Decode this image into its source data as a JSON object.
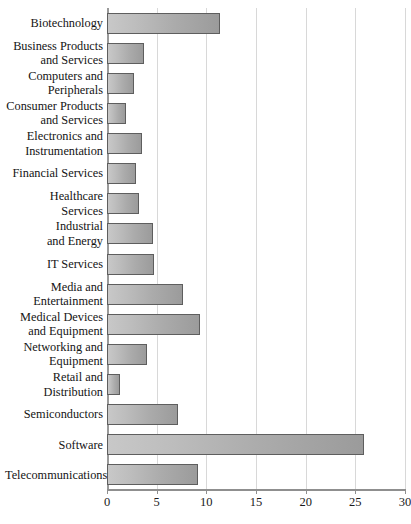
{
  "chart_data": {
    "type": "bar",
    "orientation": "horizontal",
    "title": "",
    "xlabel": "",
    "ylabel": "",
    "xlim": [
      0,
      30
    ],
    "xticks": [
      0,
      5,
      10,
      15,
      20,
      25,
      30
    ],
    "xtick_labels": [
      "0",
      "5",
      "10",
      "15",
      "20",
      "25",
      "30"
    ],
    "grid": true,
    "legend": null,
    "bar_color": "#b4b4b4",
    "bar_border_color": "#5e5e5e",
    "gridline_color": "#d8d8d8",
    "axis_color": "#8f8f8f",
    "background_color": "#ffffff",
    "categories": [
      "Biotechnology",
      "Business Products and Services",
      "Computers and Peripherals",
      "Consumer Products and Services",
      "Electronics and Instrumentation",
      "Financial Services",
      "Healthcare Services",
      "Industrial and Energy",
      "IT Services",
      "Media and Entertainment",
      "Medical Devices and Equipment",
      "Networking and Equipment",
      "Retail and Distribution",
      "Semiconductors",
      "Software",
      "Telecommunications"
    ],
    "values": [
      11.4,
      3.7,
      2.7,
      1.9,
      3.5,
      2.9,
      3.2,
      4.6,
      4.7,
      7.7,
      9.4,
      4.0,
      1.3,
      7.1,
      25.9,
      9.2
    ]
  },
  "labels": [
    {
      "lines": [
        "Biotechnology"
      ]
    },
    {
      "lines": [
        "Business Products",
        "and Services"
      ]
    },
    {
      "lines": [
        "Computers and",
        "Peripherals"
      ]
    },
    {
      "lines": [
        "Consumer Products",
        "and Services"
      ]
    },
    {
      "lines": [
        "Electronics and",
        "Instrumentation"
      ]
    },
    {
      "lines": [
        "Financial Services"
      ]
    },
    {
      "lines": [
        "Healthcare",
        "Services"
      ]
    },
    {
      "lines": [
        "Industrial",
        "and Energy"
      ]
    },
    {
      "lines": [
        "IT Services"
      ]
    },
    {
      "lines": [
        "Media and",
        "Entertainment"
      ]
    },
    {
      "lines": [
        "Medical Devices",
        "and Equipment"
      ]
    },
    {
      "lines": [
        "Networking and",
        "Equipment"
      ]
    },
    {
      "lines": [
        "Retail and",
        "Distribution"
      ]
    },
    {
      "lines": [
        "Semiconductors"
      ]
    },
    {
      "lines": [
        "Software"
      ]
    },
    {
      "lines": [
        "Telecommunications"
      ]
    }
  ]
}
